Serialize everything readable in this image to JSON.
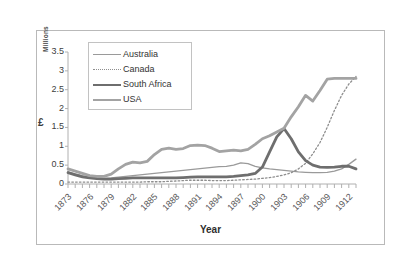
{
  "chart_data": {
    "type": "line",
    "title": "",
    "xlabel": "Year",
    "ylabel": "£",
    "y_unit_label": "Millions",
    "ylim": [
      0,
      3.5
    ],
    "ytick_labels": [
      "3.5",
      "3",
      "2.5",
      "2",
      "1.5",
      "1",
      "0.5",
      "0"
    ],
    "ytick_values": [
      3.5,
      3,
      2.5,
      2,
      1.5,
      1,
      0.5,
      0
    ],
    "xlim": [
      1873,
      1913
    ],
    "xtick_labels": [
      "1873",
      "1876",
      "1879",
      "1882",
      "1885",
      "1888",
      "1891",
      "1894",
      "1897",
      "1900",
      "1903",
      "1906",
      "1909",
      "1912"
    ],
    "xtick_values": [
      1873,
      1876,
      1879,
      1882,
      1885,
      1888,
      1891,
      1894,
      1897,
      1900,
      1903,
      1906,
      1909,
      1912
    ],
    "x_minor_tick_interval": 1,
    "grid": false,
    "legend_position": "top-left-inside",
    "x": [
      1873,
      1874,
      1875,
      1876,
      1877,
      1878,
      1879,
      1880,
      1881,
      1882,
      1883,
      1884,
      1885,
      1886,
      1887,
      1888,
      1889,
      1890,
      1891,
      1892,
      1893,
      1894,
      1895,
      1896,
      1897,
      1898,
      1899,
      1900,
      1901,
      1902,
      1903,
      1904,
      1905,
      1906,
      1907,
      1908,
      1909,
      1910,
      1911,
      1912,
      1913
    ],
    "series": [
      {
        "name": "Australia",
        "color": "#9a9a9a",
        "line_style": "solid",
        "line_width": 1.3,
        "values": [
          0.32,
          0.27,
          0.22,
          0.18,
          0.16,
          0.15,
          0.16,
          0.18,
          0.2,
          0.22,
          0.24,
          0.26,
          0.28,
          0.3,
          0.32,
          0.34,
          0.36,
          0.38,
          0.4,
          0.42,
          0.44,
          0.46,
          0.47,
          0.5,
          0.56,
          0.54,
          0.47,
          0.43,
          0.4,
          0.38,
          0.36,
          0.34,
          0.32,
          0.31,
          0.3,
          0.3,
          0.31,
          0.34,
          0.4,
          0.52,
          0.66
        ]
      },
      {
        "name": "Canada",
        "color": "#8e8e8e",
        "line_style": "dotted",
        "line_width": 1.3,
        "values": [
          0.05,
          0.05,
          0.05,
          0.05,
          0.05,
          0.05,
          0.05,
          0.05,
          0.05,
          0.05,
          0.05,
          0.06,
          0.06,
          0.06,
          0.07,
          0.08,
          0.09,
          0.1,
          0.1,
          0.1,
          0.09,
          0.09,
          0.09,
          0.1,
          0.11,
          0.12,
          0.13,
          0.15,
          0.17,
          0.2,
          0.24,
          0.3,
          0.4,
          0.55,
          0.8,
          1.1,
          1.5,
          1.95,
          2.35,
          2.65,
          2.85
        ]
      },
      {
        "name": "South Africa",
        "color": "#6e6e6e",
        "line_style": "solid",
        "line_width": 2.8,
        "values": [
          0.3,
          0.24,
          0.19,
          0.16,
          0.14,
          0.13,
          0.13,
          0.14,
          0.15,
          0.16,
          0.16,
          0.16,
          0.16,
          0.16,
          0.16,
          0.16,
          0.17,
          0.18,
          0.19,
          0.19,
          0.19,
          0.19,
          0.19,
          0.2,
          0.22,
          0.24,
          0.28,
          0.45,
          0.85,
          1.25,
          1.47,
          1.2,
          0.85,
          0.62,
          0.5,
          0.45,
          0.44,
          0.45,
          0.47,
          0.47,
          0.4
        ]
      },
      {
        "name": "USA",
        "color": "#a3a3a3",
        "line_style": "solid",
        "line_width": 2.8,
        "values": [
          0.4,
          0.34,
          0.28,
          0.22,
          0.2,
          0.2,
          0.26,
          0.4,
          0.52,
          0.58,
          0.56,
          0.6,
          0.78,
          0.92,
          0.95,
          0.92,
          0.94,
          1.02,
          1.03,
          1.02,
          0.95,
          0.86,
          0.88,
          0.9,
          0.88,
          0.92,
          1.05,
          1.2,
          1.28,
          1.38,
          1.48,
          1.78,
          2.05,
          2.35,
          2.2,
          2.48,
          2.78,
          2.8,
          2.8,
          2.8,
          2.8
        ]
      }
    ]
  },
  "legend": {
    "entries": [
      {
        "label": "Australia"
      },
      {
        "label": "Canada"
      },
      {
        "label": "South Africa"
      },
      {
        "label": "USA"
      }
    ]
  }
}
